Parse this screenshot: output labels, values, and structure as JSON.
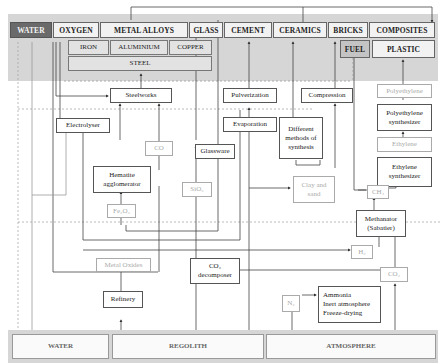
{
  "products": {
    "water": "WATER",
    "oxygen": "OXYGEN",
    "metal_alloys": "METAL ALLOYS",
    "glass": "GLASS",
    "cement": "CEMENT",
    "ceramics": "CERAMICS",
    "bricks": "BRICKS",
    "composites": "COMPOSITES",
    "iron": "IRON",
    "aluminium": "ALUMINIUM",
    "copper": "COPPER",
    "steel": "STEEL",
    "fuel": "FUEL",
    "plastic": "PLASTIC"
  },
  "processes": {
    "steelworks": "Steelworks",
    "pulverization": "Pulverization",
    "compression": "Compression",
    "polyethylene": "Polyethylene",
    "electrolyser": "Electrolyser",
    "evaporation": "Evaporation",
    "different_methods": "Different methods of synthesis",
    "polyethylene_synthesizer": "Polyethylene synthesizer",
    "co": "CO",
    "glassware": "Glassware",
    "ethylene": "Ethylene",
    "hematite_agglomerator": "Hematite agglomerator",
    "ethylene_synthesizer": "Ethylene synthesizer",
    "sio2": "SiO₂",
    "clay_and_sand": "Clay and sand",
    "ch4": "CH₄",
    "fe2o3": "Fe₂O₃",
    "methanator": "Methanator (Sabatier)",
    "h2": "H₂",
    "metal_oxides": "Metal Oxides",
    "co2_decomposer": "CO₂ decomposer",
    "co2": "CO₂",
    "refinery": "Refinery",
    "n2": "N₂",
    "ammonia_uses": "Ammonia\nInert atmosphere\nFreeze-drying"
  },
  "sources": {
    "water": "WATER",
    "regolith": "REGOLITH",
    "atmosphere": "ATMOSPHERE"
  }
}
